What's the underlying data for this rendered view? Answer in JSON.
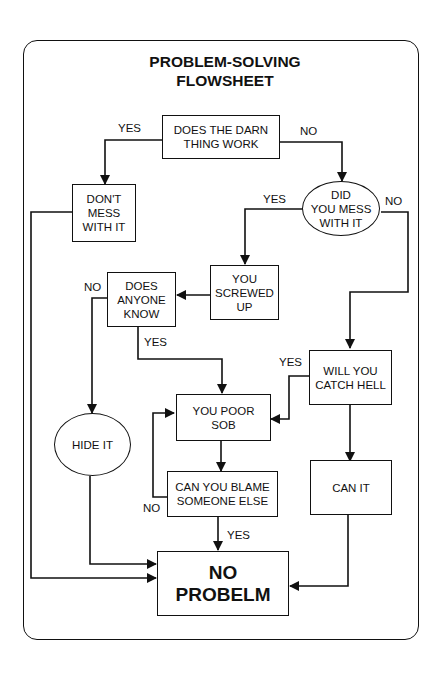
{
  "title": "PROBLEM-SOLVING\nFLOWSHEET",
  "nodes": {
    "darn_thing": "DOES THE DARN\nTHING WORK",
    "dont_mess": "DON'T\nMESS\nWITH IT",
    "did_you_mess": "DID\nYOU MESS\nWITH IT",
    "screwed_up": "YOU\nSCREWED\nUP",
    "anyone_know": "DOES\nANYONE\nKNOW",
    "catch_hell": "WILL YOU\nCATCH HELL",
    "poor_sob": "YOU POOR\nSOB",
    "hide_it": "HIDE IT",
    "blame": "CAN YOU BLAME\nSOMEONE ELSE",
    "can_it": "CAN IT",
    "no_problem": "NO\nPROBELM"
  },
  "labels": {
    "darn_yes": "YES",
    "darn_no": "NO",
    "mess_yes": "YES",
    "mess_no": "NO",
    "know_no": "NO",
    "know_yes": "YES",
    "hell_yes": "YES",
    "blame_no": "NO",
    "blame_yes": "YES"
  },
  "colors": {
    "line": "#111111",
    "background": "#ffffff"
  }
}
